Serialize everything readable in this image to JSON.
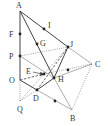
{
  "diagram": {
    "type": "geometry-figure",
    "points": {
      "A": {
        "label": "A",
        "x": 20,
        "y": 11
      },
      "F": {
        "label": "F",
        "x": 20,
        "y": 34
      },
      "P": {
        "label": "P",
        "x": 20,
        "y": 56
      },
      "O": {
        "label": "O",
        "x": 20,
        "y": 80
      },
      "Q": {
        "label": "Q",
        "x": 20,
        "y": 101
      },
      "I": {
        "label": "I",
        "x": 44,
        "y": 29
      },
      "G": {
        "label": "G",
        "x": 37,
        "y": 44
      },
      "J": {
        "label": "J",
        "x": 68,
        "y": 47
      },
      "C": {
        "label": "C",
        "x": 92,
        "y": 64
      },
      "E": {
        "label": "E",
        "x": 44,
        "y": 74
      },
      "H": {
        "label": "H",
        "x": 54,
        "y": 78
      },
      "D": {
        "label": "D",
        "x": 37,
        "y": 90
      },
      "B": {
        "label": "B",
        "x": 72,
        "y": 110
      },
      "M1": {
        "label": "",
        "x": 68,
        "y": 70
      },
      "M2": {
        "label": "",
        "x": 55,
        "y": 101
      }
    },
    "labels": [
      "A",
      "I",
      "F",
      "G",
      "J",
      "P",
      "C",
      "E",
      "O",
      "H",
      "D",
      "Q",
      "B"
    ]
  }
}
